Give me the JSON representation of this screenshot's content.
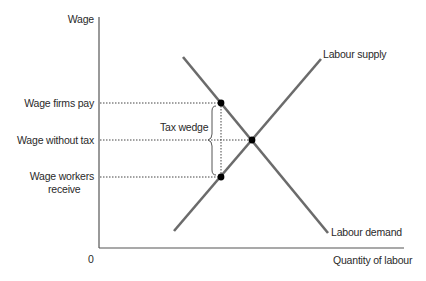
{
  "diagram": {
    "y_axis_label": "Wage",
    "x_axis_label": "Quantity of labour",
    "origin_label": "0",
    "y_levels": [
      {
        "label": "Wage firms pay"
      },
      {
        "label": "Wage without tax"
      },
      {
        "label_line1": "Wage workers",
        "label_line2": "receive"
      }
    ],
    "curves": {
      "supply": "Labour supply",
      "demand": "Labour demand"
    },
    "annotation": "Tax wedge",
    "colors": {
      "curve": "#6b6b6b",
      "axis": "#555555",
      "dot": "#000000",
      "text": "#2a2a2a"
    }
  }
}
